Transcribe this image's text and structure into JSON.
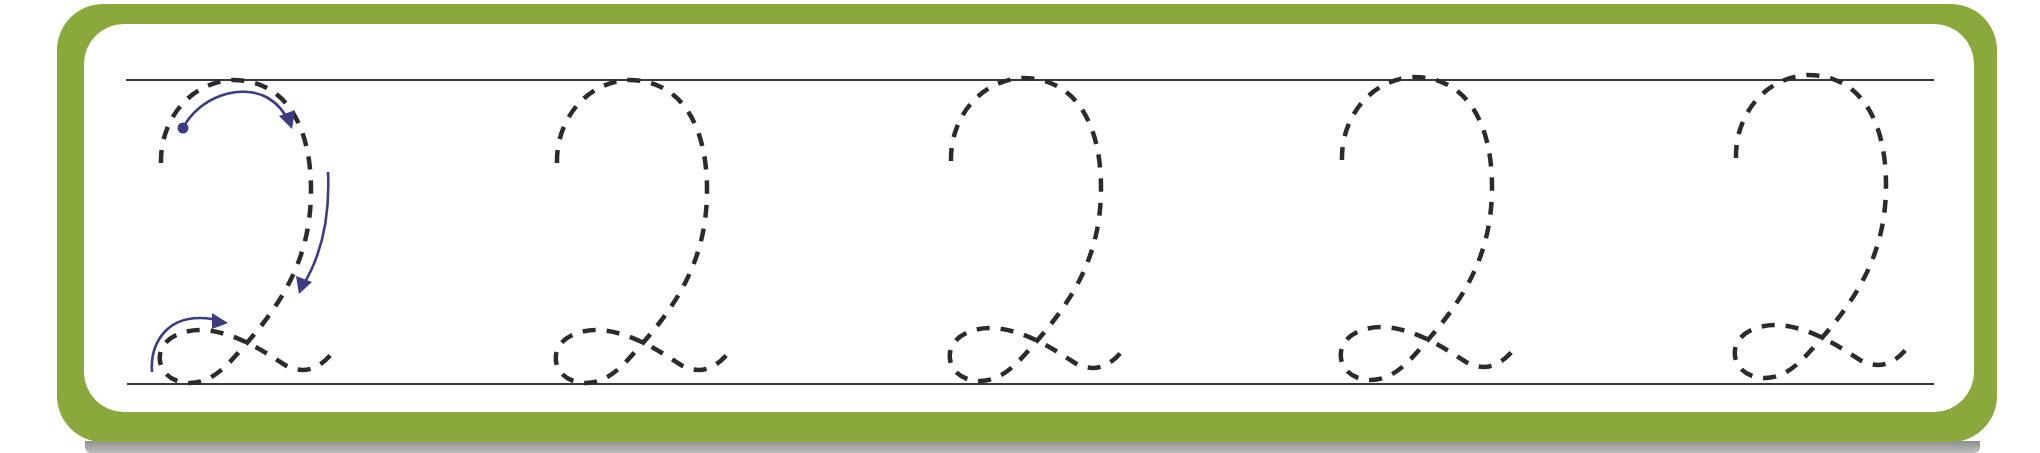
{
  "worksheet": {
    "type": "cursive handwriting tracing practice",
    "letter": "Q",
    "glyph_count": 5,
    "glyph_offsets_x": [
      0,
      396,
      790,
      1181,
      1575
    ],
    "has_stroke_guides_on_first": true,
    "colors": {
      "frame": "#8aa83c",
      "panel": "#ffffff",
      "rule_lines": "#3a3a3a",
      "dashed_trace": "#2b2b2b",
      "guide_arrows": "#3d3c80",
      "shadow": "#9e9e9e"
    },
    "rules": {
      "top_y": 80,
      "bottom_y": 384,
      "x_start": 126,
      "x_end": 1934
    }
  }
}
